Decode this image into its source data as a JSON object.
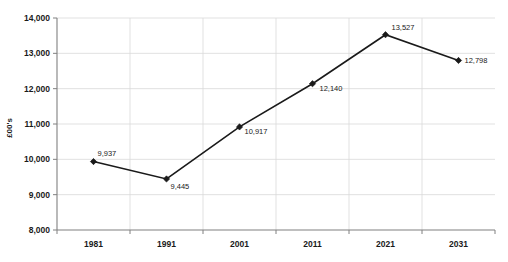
{
  "chart_data": {
    "type": "line",
    "title": "",
    "subtitle": "",
    "xlabel": "",
    "ylabel": "£00's",
    "categories": [
      "1981",
      "1991",
      "2001",
      "2011",
      "2021",
      "2031"
    ],
    "values": [
      9937,
      9445,
      10917,
      12140,
      13527,
      12798
    ],
    "point_labels": [
      "9,937",
      "9,445",
      "10,917",
      "12,140",
      "13,527",
      "12,798"
    ],
    "series": [
      {
        "name": "",
        "values": [
          9937,
          9445,
          10917,
          12140,
          13527,
          12798
        ]
      }
    ],
    "ylim": [
      8000,
      14000
    ],
    "yticks": [
      8000,
      9000,
      10000,
      11000,
      12000,
      13000,
      14000
    ],
    "ytick_labels": [
      "8,000",
      "9,000",
      "10,000",
      "11,000",
      "12,000",
      "13,000",
      "14,000"
    ],
    "xticks": [
      "1981",
      "1991",
      "2001",
      "2011",
      "2021",
      "2031"
    ],
    "grid": "horizontal-and-vertical",
    "legend": "none",
    "marker": "diamond",
    "colors": {
      "line": "#1a1a1a",
      "marker": "#1a1a1a",
      "grid": "#d9d9d9",
      "axis": "#808080",
      "text": "#1a1a1a",
      "background": "#ffffff"
    }
  }
}
